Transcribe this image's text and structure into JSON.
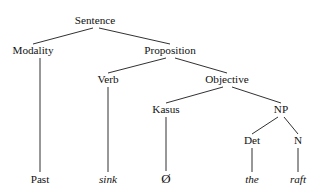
{
  "figure": {
    "kind": "syntax-tree",
    "width": 322,
    "height": 193,
    "background_color": "#ffffff",
    "line_color": "#1a1a1a",
    "text_color": "#111111"
  },
  "nodes": [
    {
      "id": "sentence",
      "label": "Sentence",
      "x": 95,
      "y": 24,
      "style": "roman",
      "level": 0
    },
    {
      "id": "modality",
      "label": "Modality",
      "x": 33,
      "y": 54,
      "style": "roman",
      "level": 1
    },
    {
      "id": "proposition",
      "label": "Proposition",
      "x": 170,
      "y": 54,
      "style": "roman",
      "level": 1
    },
    {
      "id": "verb",
      "label": "Verb",
      "x": 108,
      "y": 83,
      "style": "roman",
      "level": 2
    },
    {
      "id": "objective",
      "label": "Objective",
      "x": 227,
      "y": 83,
      "style": "roman",
      "level": 2
    },
    {
      "id": "kasus",
      "label": "Kasus",
      "x": 166,
      "y": 113,
      "style": "roman",
      "level": 3
    },
    {
      "id": "np",
      "label": "NP",
      "x": 281,
      "y": 113,
      "style": "roman",
      "level": 3
    },
    {
      "id": "det",
      "label": "Det",
      "x": 252,
      "y": 144,
      "style": "roman",
      "level": 4
    },
    {
      "id": "n",
      "label": "N",
      "x": 298,
      "y": 144,
      "style": "roman",
      "level": 4
    },
    {
      "id": "past",
      "label": "Past",
      "x": 40,
      "y": 183,
      "style": "roman",
      "level": 5
    },
    {
      "id": "sink",
      "label": "sink",
      "x": 108,
      "y": 183,
      "style": "italic",
      "level": 5
    },
    {
      "id": "null",
      "label": "Ø",
      "x": 166,
      "y": 183,
      "style": "null",
      "level": 5
    },
    {
      "id": "the",
      "label": "the",
      "x": 252,
      "y": 183,
      "style": "italic",
      "level": 5
    },
    {
      "id": "raft",
      "label": "raft",
      "x": 298,
      "y": 183,
      "style": "italic",
      "level": 5
    }
  ],
  "edges": [
    {
      "id": "sentence-modality",
      "from": "sentence",
      "to": "modality",
      "x1": 93,
      "y1": 28,
      "x2": 33,
      "y2": 44
    },
    {
      "id": "sentence-proposition",
      "from": "sentence",
      "to": "proposition",
      "x1": 99,
      "y1": 28,
      "x2": 170,
      "y2": 44
    },
    {
      "id": "modality-past",
      "from": "modality",
      "to": "past",
      "x1": 40,
      "y1": 58,
      "x2": 40,
      "y2": 172
    },
    {
      "id": "proposition-verb",
      "from": "proposition",
      "to": "verb",
      "x1": 166,
      "y1": 58,
      "x2": 108,
      "y2": 73
    },
    {
      "id": "proposition-objective",
      "from": "proposition",
      "to": "objective",
      "x1": 175,
      "y1": 58,
      "x2": 227,
      "y2": 73
    },
    {
      "id": "verb-sink",
      "from": "verb",
      "to": "sink",
      "x1": 108,
      "y1": 87,
      "x2": 108,
      "y2": 172
    },
    {
      "id": "objective-kasus",
      "from": "objective",
      "to": "kasus",
      "x1": 223,
      "y1": 87,
      "x2": 166,
      "y2": 103
    },
    {
      "id": "objective-np",
      "from": "objective",
      "to": "np",
      "x1": 232,
      "y1": 87,
      "x2": 281,
      "y2": 103
    },
    {
      "id": "kasus-null",
      "from": "kasus",
      "to": "null",
      "x1": 166,
      "y1": 117,
      "x2": 166,
      "y2": 171
    },
    {
      "id": "np-det",
      "from": "np",
      "to": "det",
      "x1": 278,
      "y1": 117,
      "x2": 252,
      "y2": 134
    },
    {
      "id": "np-n",
      "from": "np",
      "to": "n",
      "x1": 284,
      "y1": 117,
      "x2": 298,
      "y2": 134
    },
    {
      "id": "det-the",
      "from": "det",
      "to": "the",
      "x1": 252,
      "y1": 148,
      "x2": 252,
      "y2": 172
    },
    {
      "id": "n-raft",
      "from": "n",
      "to": "raft",
      "x1": 298,
      "y1": 148,
      "x2": 298,
      "y2": 172
    }
  ]
}
